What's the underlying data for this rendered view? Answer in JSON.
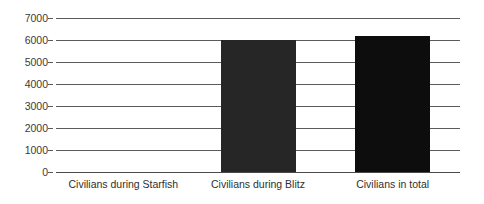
{
  "chart_data": {
    "type": "bar",
    "title": "",
    "subtitle": "",
    "xlabel": "",
    "ylabel": "",
    "categories": [
      "Civilians during Starfish",
      "Civilians during Blitz",
      "Civilians in total"
    ],
    "values": [
      0,
      6000,
      6180
    ],
    "series": [
      {
        "name": "Civilians",
        "values": [
          0,
          6000,
          6180
        ]
      }
    ],
    "ylim": [
      0,
      7000
    ],
    "y_ticks": [
      0,
      1000,
      2000,
      3000,
      4000,
      5000,
      6000,
      7000
    ],
    "y_tick_labels": [
      "0",
      "1000",
      "2000",
      "3000",
      "4000",
      "5000",
      "6000",
      "7000"
    ],
    "grid": true,
    "legend": false,
    "legend_position": "none",
    "bar_colors": [
      "#262626",
      "#262626",
      "#0d0d0d"
    ],
    "background_color": "#ffffff",
    "gridline_color": "#5b5b5b",
    "axis_text_color": "#3a3a3a"
  },
  "axis": {
    "y_labels": [
      "7000",
      "6000",
      "5000",
      "4000",
      "3000",
      "2000",
      "1000",
      "0"
    ]
  },
  "categories": {
    "items": [
      {
        "label": "Civilians during Starfish"
      },
      {
        "label": "Civilians during Blitz"
      },
      {
        "label": "Civilians in total"
      }
    ]
  }
}
